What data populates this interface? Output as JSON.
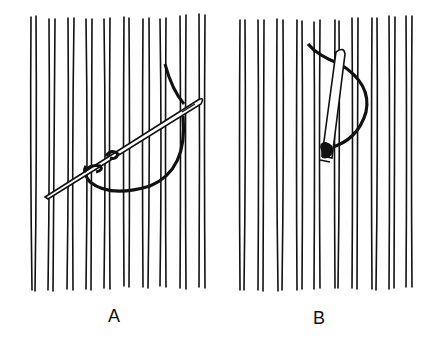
{
  "figure": {
    "panels": [
      {
        "id": "A",
        "label": "A",
        "needle_orientation": "diagonal, lower-left to upper-right"
      },
      {
        "id": "B",
        "label": "B",
        "needle_orientation": "near-vertical, slightly tilted"
      }
    ],
    "colors": {
      "ink": "#111111",
      "background": "#ffffff"
    }
  }
}
